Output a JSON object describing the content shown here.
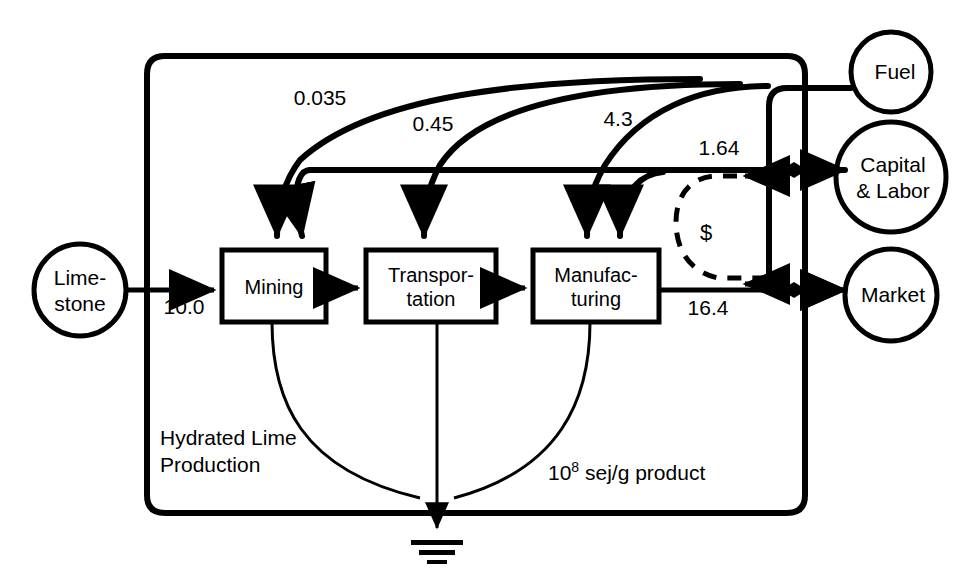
{
  "diagram": {
    "system_boundary_label_line1": "Hydrated Lime",
    "system_boundary_label_line2": "Production",
    "units_prefix": "10",
    "units_exponent": "8",
    "units_suffix": " sej/g product",
    "money_symbol": "$"
  },
  "sources": [
    {
      "id": "limestone",
      "label_line1": "Lime-",
      "label_line2": "stone",
      "shape": "circle"
    },
    {
      "id": "fuel",
      "label_line1": "Fuel",
      "label_line2": "",
      "shape": "circle"
    },
    {
      "id": "capital_labor",
      "label_line1": "Capital",
      "label_line2": "& Labor",
      "shape": "circle"
    },
    {
      "id": "market",
      "label_line1": "Market",
      "label_line2": "",
      "shape": "circle"
    }
  ],
  "processes": [
    {
      "id": "mining",
      "label_line1": "Mining",
      "label_line2": ""
    },
    {
      "id": "transportation",
      "label_line1": "Transpor-",
      "label_line2": "tation"
    },
    {
      "id": "manufacturing",
      "label_line1": "Manufac-",
      "label_line2": "turing"
    }
  ],
  "flows": [
    {
      "id": "limestone-to-mining",
      "value": "10.0",
      "from": "limestone",
      "to": "mining"
    },
    {
      "id": "fuel-to-mining",
      "value": "0.035",
      "from": "fuel",
      "to": "mining"
    },
    {
      "id": "capital-to-mining",
      "value": "0.45",
      "from": "capital_labor",
      "to": "mining"
    },
    {
      "id": "fuel-to-transportation",
      "value": "0.45",
      "from": "fuel",
      "to": "transportation"
    },
    {
      "id": "fuel-to-manufacturing",
      "value": "4.3",
      "from": "fuel",
      "to": "manufacturing"
    },
    {
      "id": "capital-to-manufacturing",
      "value": "1.64",
      "from": "capital_labor",
      "to": "manufacturing"
    },
    {
      "id": "manufacturing-to-market",
      "value": "16.4",
      "from": "manufacturing",
      "to": "market"
    }
  ],
  "colors": {
    "line": "#000000",
    "background": "#ffffff",
    "text": "#000000"
  }
}
